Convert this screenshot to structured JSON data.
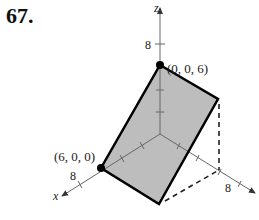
{
  "problem_number": "67.",
  "axes": {
    "x": {
      "label": "x",
      "tick": "8"
    },
    "y": {
      "label": "y",
      "tick": "8"
    },
    "z": {
      "label": "z",
      "tick": "8"
    }
  },
  "points": [
    {
      "label": "(0, 0, 6)"
    },
    {
      "label": "(6, 0, 0)"
    }
  ],
  "colors": {
    "plane_fill": "#b8b8b8",
    "edge": "#000000",
    "axis": "#555555"
  }
}
